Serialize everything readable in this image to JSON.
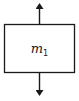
{
  "diagram": {
    "type": "free-body diagram",
    "body": {
      "shape": "rectangle",
      "label": "m",
      "label_subscript": "1"
    },
    "forces": [
      {
        "direction": "up",
        "from": "top-center"
      },
      {
        "direction": "down",
        "from": "bottom-center"
      }
    ],
    "colors": {
      "stroke": "#1a1a1a",
      "background": "#ffffff"
    }
  }
}
